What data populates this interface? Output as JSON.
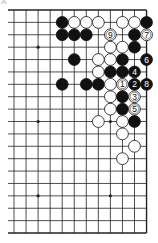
{
  "diagram": {
    "label": "A",
    "board": {
      "size": 19,
      "visible_cols": 12,
      "visible_rows": 19,
      "left_edge_open": true,
      "origin_x": 14,
      "origin_y": 10,
      "spacing_x": 12.05,
      "spacing_y": 12.39,
      "left_overhang_x": 8,
      "stone_radius": 5.9,
      "line_color": "#222222",
      "black_color": "#111111",
      "white_color": "#ffffff"
    },
    "star_points": [
      {
        "col": 2,
        "row": 3
      },
      {
        "col": 8,
        "row": 3
      },
      {
        "col": 2,
        "row": 9
      },
      {
        "col": 8,
        "row": 9
      },
      {
        "col": 2,
        "row": 15
      },
      {
        "col": 8,
        "row": 15
      }
    ],
    "stones": [
      {
        "col": 4,
        "row": 1,
        "color": "black"
      },
      {
        "col": 5,
        "row": 1,
        "color": "white"
      },
      {
        "col": 6,
        "row": 1,
        "color": "white"
      },
      {
        "col": 7,
        "row": 1,
        "color": "white"
      },
      {
        "col": 9,
        "row": 1,
        "color": "white"
      },
      {
        "col": 10,
        "row": 1,
        "color": "white"
      },
      {
        "col": 11,
        "row": 1,
        "color": "black"
      },
      {
        "col": 4,
        "row": 2,
        "color": "black"
      },
      {
        "col": 5,
        "row": 2,
        "color": "black"
      },
      {
        "col": 6,
        "row": 2,
        "color": "black"
      },
      {
        "col": 8,
        "row": 2,
        "color": "white",
        "label": "9"
      },
      {
        "col": 10,
        "row": 2,
        "color": "black"
      },
      {
        "col": 11,
        "row": 2,
        "color": "white",
        "label": "7"
      },
      {
        "col": 8,
        "row": 3,
        "color": "white"
      },
      {
        "col": 9,
        "row": 3,
        "color": "white"
      },
      {
        "col": 10,
        "row": 3,
        "color": "black"
      },
      {
        "col": 5,
        "row": 4,
        "color": "black"
      },
      {
        "col": 7,
        "row": 4,
        "color": "white"
      },
      {
        "col": 8,
        "row": 4,
        "color": "white"
      },
      {
        "col": 9,
        "row": 4,
        "color": "black"
      },
      {
        "col": 11,
        "row": 4,
        "color": "black",
        "label": "6"
      },
      {
        "col": 7,
        "row": 5,
        "color": "white"
      },
      {
        "col": 8,
        "row": 5,
        "color": "black"
      },
      {
        "col": 9,
        "row": 5,
        "color": "black"
      },
      {
        "col": 10,
        "row": 5,
        "color": "black",
        "label": "4"
      },
      {
        "col": 4,
        "row": 6,
        "color": "black"
      },
      {
        "col": 6,
        "row": 6,
        "color": "black"
      },
      {
        "col": 7,
        "row": 6,
        "color": "black"
      },
      {
        "col": 8,
        "row": 6,
        "color": "white"
      },
      {
        "col": 9,
        "row": 6,
        "color": "white",
        "label": "1"
      },
      {
        "col": 10,
        "row": 6,
        "color": "black",
        "label": "2"
      },
      {
        "col": 11,
        "row": 6,
        "color": "black",
        "label": "8"
      },
      {
        "col": 8,
        "row": 7,
        "color": "white"
      },
      {
        "col": 9,
        "row": 7,
        "color": "black"
      },
      {
        "col": 10,
        "row": 7,
        "color": "white",
        "label": "3"
      },
      {
        "col": 8,
        "row": 8,
        "color": "white"
      },
      {
        "col": 9,
        "row": 8,
        "color": "black"
      },
      {
        "col": 10,
        "row": 8,
        "color": "white",
        "label": "5"
      },
      {
        "col": 7,
        "row": 9,
        "color": "white"
      },
      {
        "col": 9,
        "row": 9,
        "color": "white"
      },
      {
        "col": 10,
        "row": 9,
        "color": "black"
      },
      {
        "col": 9,
        "row": 10,
        "color": "white"
      },
      {
        "col": 10,
        "row": 11,
        "color": "white"
      },
      {
        "col": 9,
        "row": 12,
        "color": "white"
      }
    ]
  }
}
